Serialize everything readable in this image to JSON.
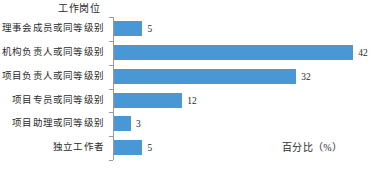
{
  "chart_data": {
    "type": "bar",
    "orientation": "horizontal",
    "title": "",
    "ylabel": "工作岗位",
    "xlabel": "百分比（%）",
    "categories": [
      "理事会成员或同等级别",
      "机构负责人或同等级别",
      "项目负责人或同等级别",
      "项目专员或同等级别",
      "项目助理或同等级别",
      "独立工作者"
    ],
    "values": [
      5,
      42,
      32,
      12,
      3,
      5
    ],
    "value_labels": [
      "5",
      "42",
      "32",
      "12",
      "3",
      "5"
    ],
    "xlim": [
      0,
      46
    ],
    "grid": false,
    "legend": null,
    "bar_color": "#4A97D6",
    "axis_color": "#9a9a9a",
    "text_color": "#2b2b2b",
    "background": "#ffffff"
  }
}
